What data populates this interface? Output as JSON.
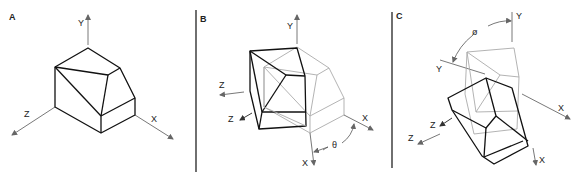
{
  "figure": {
    "panels": [
      {
        "id": "A",
        "label": "A",
        "axes": {
          "x": "X",
          "y": "Y",
          "z": "Z"
        }
      },
      {
        "id": "B",
        "label": "B",
        "axes": {
          "x_original": "X",
          "x_rotated": "X",
          "y": "Y",
          "z_original": "Z",
          "z_rotated": "Z"
        },
        "angle_symbol": "θ"
      },
      {
        "id": "C",
        "label": "C",
        "axes": {
          "x_original": "X",
          "x_rotated": "X",
          "y_original": "Y",
          "y_rotated": "Y",
          "z_original": "Z",
          "z_rotated": "Z"
        },
        "angle_symbol": "ø"
      }
    ]
  },
  "colors": {
    "solid_edges": "#111111",
    "ghost_edges": "#aaaaaa",
    "axis": "#555555",
    "background": "#ffffff"
  }
}
